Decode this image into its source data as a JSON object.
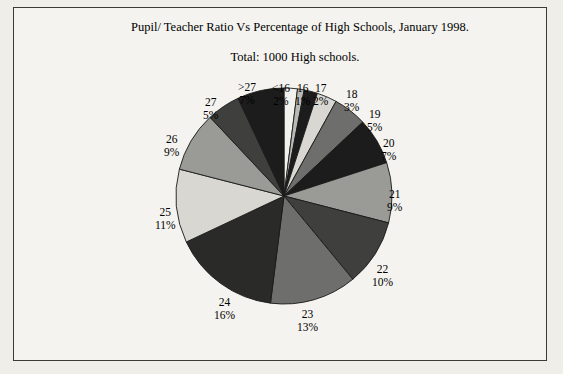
{
  "chart_data": {
    "type": "pie",
    "title": "Pupil/ Teacher Ratio Vs Percentage of High Schools, January 1998.",
    "subtitle": "Total: 1000 High schools.",
    "xlabel": "",
    "ylabel": "",
    "legend": "none",
    "categories": [
      "<16",
      "16",
      "17",
      "18",
      "19",
      "20",
      "21",
      "22",
      "23",
      "24",
      "25",
      "26",
      "27",
      ">27"
    ],
    "values": [
      2,
      1,
      2,
      3,
      5,
      7,
      9,
      10,
      13,
      16,
      11,
      9,
      5,
      7
    ],
    "value_unit": "%",
    "labels": [
      {
        "name": "<16",
        "pct": "2%"
      },
      {
        "name": "16",
        "pct": "1%"
      },
      {
        "name": "17",
        "pct": "2%"
      },
      {
        "name": "18",
        "pct": "3%"
      },
      {
        "name": "19",
        "pct": "5%"
      },
      {
        "name": "20",
        "pct": "7%"
      },
      {
        "name": "21",
        "pct": "9%"
      },
      {
        "name": "22",
        "pct": "10%"
      },
      {
        "name": "23",
        "pct": "13%"
      },
      {
        "name": "24",
        "pct": "16%"
      },
      {
        "name": "25",
        "pct": "11%"
      },
      {
        "name": "26",
        "pct": "9%"
      },
      {
        "name": "27",
        "pct": "5%"
      },
      {
        "name": ">27",
        "pct": "7%"
      }
    ],
    "slice_colors": [
      "#f2f1ed",
      "#b9b9b5",
      "#1c1c1c",
      "#d8d7d2",
      "#6e6e6c",
      "#1c1c1c",
      "#9a9a96",
      "#3f3f3d",
      "#6e6e6c",
      "#2a2a28",
      "#d8d7d2",
      "#9a9a96",
      "#3f3f3d",
      "#1c1c1c"
    ],
    "background": "#f4f3ef",
    "border_color": "#3a3a38"
  },
  "page": {
    "bleed_texts": [
      "•",
      "16",
      "17",
      "18",
      "19",
      "20"
    ]
  }
}
